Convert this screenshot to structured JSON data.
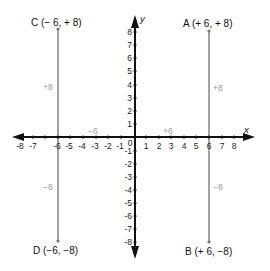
{
  "diagram": {
    "type": "coordinate-plane",
    "axes": {
      "x_label": "x",
      "y_label": "y",
      "x_range": [
        -8,
        8
      ],
      "y_range": [
        -8,
        8
      ],
      "x_ticks": [
        "-8",
        "-7",
        "-6",
        "-5",
        "-4",
        "-3",
        "-2",
        "-1",
        "0",
        "1",
        "2",
        "3",
        "4",
        "5",
        "6",
        "7",
        "8"
      ],
      "y_ticks_positive": [
        "8",
        "7",
        "6",
        "5",
        "4",
        "3",
        "2",
        "1"
      ],
      "y_ticks_negative": [
        "-1",
        "-2",
        "-3",
        "-4",
        "-5",
        "-6",
        "-7",
        "-8"
      ]
    },
    "points": [
      {
        "id": "A",
        "label": "A (+ 6, + 8)",
        "x": 6,
        "y": 8
      },
      {
        "id": "B",
        "label": "B (+ 6, −8)",
        "x": 6,
        "y": -8
      },
      {
        "id": "C",
        "label": "C (− 6, + 8)",
        "x": -6,
        "y": 8
      },
      {
        "id": "D",
        "label": "D (−6, −8)",
        "x": -6,
        "y": -8
      }
    ],
    "segment_labels": {
      "neg_x": "−6",
      "pos_x": "+6",
      "a_vertical": "+8",
      "b_vertical": "−8",
      "c_vertical": "+8",
      "d_vertical": "−8"
    },
    "colors": {
      "axis": "#111111",
      "vertical_lines": "#8c8c8c",
      "gray_text": "#9a9a9a"
    }
  }
}
